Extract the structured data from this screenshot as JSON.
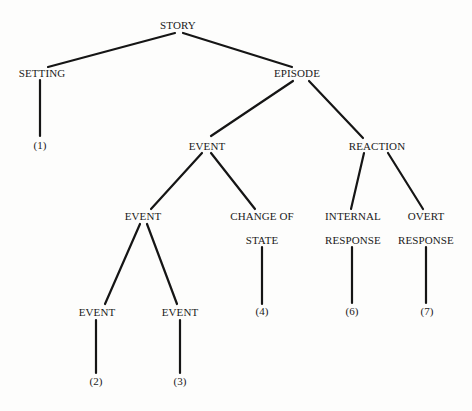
{
  "diagram": {
    "type": "tree",
    "nodes": [
      {
        "id": "story",
        "label": "STORY",
        "x": 178,
        "y": 25
      },
      {
        "id": "setting",
        "label": "SETTING",
        "x": 42,
        "y": 73
      },
      {
        "id": "setting_leaf",
        "label": "(1)",
        "x": 40,
        "y": 145
      },
      {
        "id": "episode",
        "label": "EPISODE",
        "x": 297,
        "y": 73
      },
      {
        "id": "event_a",
        "label": "EVENT",
        "x": 207,
        "y": 146
      },
      {
        "id": "reaction",
        "label": "REACTION",
        "x": 377,
        "y": 146
      },
      {
        "id": "event_b",
        "label": "EVENT",
        "x": 143,
        "y": 216
      },
      {
        "id": "change_of_state_1",
        "label": "CHANGE OF",
        "x": 262,
        "y": 216
      },
      {
        "id": "change_of_state_2",
        "label": "STATE",
        "x": 262,
        "y": 240
      },
      {
        "id": "change_leaf",
        "label": "(4)",
        "x": 262,
        "y": 311
      },
      {
        "id": "internal_1",
        "label": "INTERNAL",
        "x": 353,
        "y": 216
      },
      {
        "id": "internal_2",
        "label": "RESPONSE",
        "x": 353,
        "y": 240
      },
      {
        "id": "internal_leaf",
        "label": "(6)",
        "x": 352,
        "y": 311
      },
      {
        "id": "overt_1",
        "label": "OVERT",
        "x": 426,
        "y": 216
      },
      {
        "id": "overt_2",
        "label": "RESPONSE",
        "x": 426,
        "y": 240
      },
      {
        "id": "overt_leaf",
        "label": "(7)",
        "x": 427,
        "y": 311
      },
      {
        "id": "event_c",
        "label": "EVENT",
        "x": 97,
        "y": 312
      },
      {
        "id": "event_c_leaf",
        "label": "(2)",
        "x": 96,
        "y": 381
      },
      {
        "id": "event_d",
        "label": "EVENT",
        "x": 180,
        "y": 312
      },
      {
        "id": "event_d_leaf",
        "label": "(3)",
        "x": 180,
        "y": 381
      }
    ],
    "edges": [
      {
        "from": "story",
        "to": "setting",
        "x1": 175,
        "y1": 33,
        "x2": 48,
        "y2": 67
      },
      {
        "from": "story",
        "to": "episode",
        "x1": 183,
        "y1": 33,
        "x2": 292,
        "y2": 67
      },
      {
        "from": "setting",
        "to": "setting_leaf",
        "x1": 40,
        "y1": 80,
        "x2": 40,
        "y2": 136
      },
      {
        "from": "episode",
        "to": "event_a",
        "x1": 293,
        "y1": 81,
        "x2": 211,
        "y2": 136
      },
      {
        "from": "episode",
        "to": "reaction",
        "x1": 309,
        "y1": 81,
        "x2": 363,
        "y2": 138
      },
      {
        "from": "event_a",
        "to": "event_b",
        "x1": 202,
        "y1": 153,
        "x2": 151,
        "y2": 209
      },
      {
        "from": "event_a",
        "to": "change_of_state",
        "x1": 211,
        "y1": 153,
        "x2": 255,
        "y2": 209
      },
      {
        "from": "reaction",
        "to": "internal_response",
        "x1": 364,
        "y1": 153,
        "x2": 351,
        "y2": 209
      },
      {
        "from": "reaction",
        "to": "overt_response",
        "x1": 388,
        "y1": 153,
        "x2": 423,
        "y2": 209
      },
      {
        "from": "event_b",
        "to": "event_c",
        "x1": 140,
        "y1": 224,
        "x2": 105,
        "y2": 304
      },
      {
        "from": "event_b",
        "to": "event_d",
        "x1": 147,
        "y1": 224,
        "x2": 177,
        "y2": 304
      },
      {
        "from": "change_of_state",
        "to": "change_leaf",
        "x1": 262,
        "y1": 247,
        "x2": 262,
        "y2": 304
      },
      {
        "from": "internal_response",
        "to": "internal_leaf",
        "x1": 352,
        "y1": 247,
        "x2": 352,
        "y2": 303
      },
      {
        "from": "overt_response",
        "to": "overt_leaf",
        "x1": 426,
        "y1": 247,
        "x2": 426,
        "y2": 303
      },
      {
        "from": "event_c",
        "to": "event_c_leaf",
        "x1": 96,
        "y1": 320,
        "x2": 96,
        "y2": 373
      },
      {
        "from": "event_d",
        "to": "event_d_leaf",
        "x1": 180,
        "y1": 320,
        "x2": 180,
        "y2": 373
      }
    ]
  }
}
